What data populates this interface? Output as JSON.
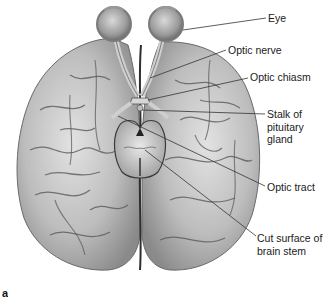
{
  "figure": {
    "type": "anatomical-illustration",
    "panel_letter": "a",
    "labels": [
      {
        "id": "eye",
        "text": "Eye",
        "x": 268,
        "y": 12,
        "line_from": [
          255,
          20
        ],
        "line_to": [
          266,
          18
        ]
      },
      {
        "id": "optic-nerve",
        "text": "Optic nerve",
        "x": 228,
        "y": 44,
        "line_from": [
          195,
          65
        ],
        "line_to": [
          226,
          50
        ]
      },
      {
        "id": "optic-chiasm",
        "text": "Optic chiasm",
        "x": 250,
        "y": 71,
        "line_from": [
          140,
          97
        ],
        "line_to": [
          248,
          78
        ]
      },
      {
        "id": "stalk-pituitary",
        "text": [
          "Stalk of",
          "pituitary",
          "gland"
        ],
        "x": 267,
        "y": 111,
        "line_from": [
          150,
          112
        ],
        "line_to": [
          265,
          114
        ]
      },
      {
        "id": "optic-tract",
        "text": "Optic tract",
        "x": 267,
        "y": 181,
        "line_from": [
          127,
          110
        ],
        "line_to": [
          265,
          186
        ]
      },
      {
        "id": "cut-surface",
        "text": [
          "Cut surface of",
          "brain stem"
        ],
        "x": 257,
        "y": 232,
        "line_from": [
          145,
          150
        ],
        "line_to": [
          256,
          236
        ]
      }
    ],
    "colors": {
      "background": "#ffffff",
      "brain_light": "#d8d8d8",
      "brain_mid": "#a8a8a8",
      "brain_dark": "#4a4a4a",
      "leader_line": "#333333",
      "label_text": "#1a1a1a"
    }
  }
}
